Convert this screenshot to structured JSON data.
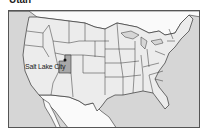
{
  "title": "Utah",
  "map": {
    "region": "United States",
    "highlighted_state": "Utah",
    "city": {
      "name": "Salt Lake City",
      "marker": "dot"
    },
    "colors": {
      "water": "#d6d6d6",
      "us_land": "#ececec",
      "foreign_land": "#fafafa",
      "highlight": "#a8a8a8",
      "border": "#333333"
    }
  }
}
